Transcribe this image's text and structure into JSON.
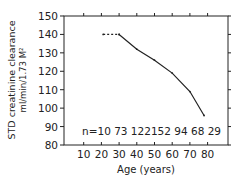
{
  "chart_data": {
    "type": "line",
    "title": "",
    "xlabel": "Age (years)",
    "ylabel": "STD creatinine clearance",
    "ylabel_units": "ml/min/1.73 M²",
    "x_ticks": [
      "10",
      "20",
      "30",
      "40",
      "50",
      "60",
      "70",
      "80"
    ],
    "y_ticks": [
      "80",
      "90",
      "100",
      "110",
      "120",
      "130",
      "140",
      "150"
    ],
    "xlim": [
      0,
      90
    ],
    "ylim": [
      80,
      150
    ],
    "series": [
      {
        "name": "extrapolated",
        "style": "dashed",
        "x": [
          21,
          30
        ],
        "y": [
          140,
          140
        ]
      },
      {
        "name": "STD creatinine clearance",
        "style": "solid",
        "x": [
          30,
          40,
          50,
          60,
          70,
          78
        ],
        "y": [
          140,
          132,
          126,
          119,
          109,
          96
        ]
      }
    ],
    "annotation": {
      "prefix": "n=",
      "counts": [
        "10",
        "73",
        "122",
        "152",
        "94",
        "68",
        "29"
      ]
    }
  }
}
